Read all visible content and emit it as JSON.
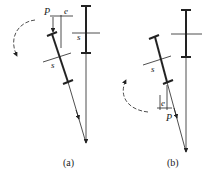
{
  "figure": {
    "panels": [
      {
        "id": "a",
        "caption": "(a)",
        "labels": {
          "load": "P",
          "eccentricity": "e",
          "section_tilted": "s",
          "section_vertical": "s"
        }
      },
      {
        "id": "b",
        "caption": "(b)",
        "labels": {
          "load": "P",
          "eccentricity": "e",
          "section_tilted": "s"
        }
      }
    ],
    "colors": {
      "line": "#222222",
      "background": "#ffffff"
    }
  }
}
